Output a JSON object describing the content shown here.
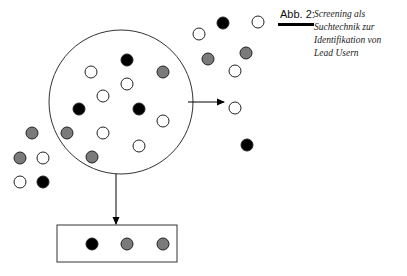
{
  "figure": {
    "label": "Abb. 2:",
    "caption_lines": [
      "Screening als",
      "Suchtechnik zur",
      "Identifikation von",
      "Lead Usern"
    ]
  },
  "colors": {
    "black": "#000000",
    "gray": "#7a7a7a",
    "white": "#ffffff",
    "stroke": "#333333"
  },
  "screen_circle": {
    "cx": 121,
    "cy": 102,
    "r": 72
  },
  "result_box": {
    "x": 57,
    "y": 225,
    "width": 120,
    "height": 37
  },
  "dots": {
    "inside_circle": [
      {
        "x": 127,
        "y": 60,
        "type": "black"
      },
      {
        "x": 91,
        "y": 72,
        "type": "white"
      },
      {
        "x": 163,
        "y": 72,
        "type": "gray"
      },
      {
        "x": 127,
        "y": 84,
        "type": "white"
      },
      {
        "x": 103,
        "y": 96,
        "type": "white"
      },
      {
        "x": 79,
        "y": 109,
        "type": "black"
      },
      {
        "x": 139,
        "y": 109,
        "type": "black"
      },
      {
        "x": 163,
        "y": 121,
        "type": "white"
      },
      {
        "x": 67,
        "y": 133,
        "type": "gray"
      },
      {
        "x": 103,
        "y": 133,
        "type": "white"
      },
      {
        "x": 139,
        "y": 146,
        "type": "white"
      },
      {
        "x": 92,
        "y": 157,
        "type": "gray"
      }
    ],
    "outside": [
      {
        "x": 223,
        "y": 23,
        "type": "black"
      },
      {
        "x": 258,
        "y": 22,
        "type": "white"
      },
      {
        "x": 199,
        "y": 34,
        "type": "white"
      },
      {
        "x": 208,
        "y": 59,
        "type": "gray"
      },
      {
        "x": 246,
        "y": 53,
        "type": "gray"
      },
      {
        "x": 235,
        "y": 71,
        "type": "white"
      },
      {
        "x": 235,
        "y": 108,
        "type": "white"
      },
      {
        "x": 247,
        "y": 145,
        "type": "black"
      },
      {
        "x": 32,
        "y": 133,
        "type": "gray"
      },
      {
        "x": 20,
        "y": 158,
        "type": "gray"
      },
      {
        "x": 43,
        "y": 158,
        "type": "white"
      },
      {
        "x": 20,
        "y": 182,
        "type": "white"
      },
      {
        "x": 43,
        "y": 182,
        "type": "black"
      }
    ],
    "in_box": [
      {
        "x": 92,
        "y": 244,
        "type": "black"
      },
      {
        "x": 127,
        "y": 244,
        "type": "gray"
      },
      {
        "x": 163,
        "y": 244,
        "type": "gray"
      }
    ]
  },
  "arrows": [
    {
      "name": "arrow-right",
      "x1": 188,
      "y1": 102,
      "x2": 224,
      "y2": 102
    },
    {
      "name": "arrow-down",
      "x1": 116,
      "y1": 174,
      "x2": 116,
      "y2": 224
    }
  ]
}
